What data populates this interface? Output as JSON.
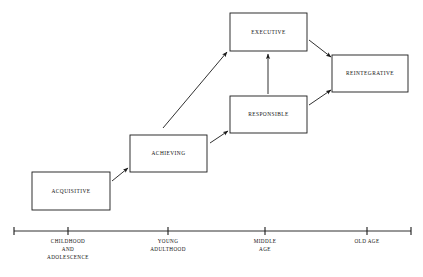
{
  "diagram": {
    "type": "staircase-flow-diagram",
    "background_color": "#ffffff",
    "line_color": "#1a1a1a",
    "stages": [
      {
        "id": "acquisitive",
        "label": "ACQUISITIVE",
        "box": {
          "x": 32,
          "y": 172,
          "width": 78,
          "height": 38
        },
        "center": {
          "x": 71,
          "y": 191
        },
        "order": 1
      },
      {
        "id": "achieving",
        "label": "ACHIEVING",
        "box": {
          "x": 130,
          "y": 135,
          "width": 77,
          "height": 37
        },
        "center": {
          "x": 168.5,
          "y": 153.5
        },
        "order": 2
      },
      {
        "id": "responsible",
        "label": "RESPONSIBLE",
        "box": {
          "x": 230,
          "y": 96,
          "width": 77,
          "height": 37
        },
        "center": {
          "x": 268.5,
          "y": 114.5
        },
        "order": 3
      },
      {
        "id": "executive",
        "label": "EXECUTIVE",
        "box": {
          "x": 230,
          "y": 13,
          "width": 77,
          "height": 38
        },
        "center": {
          "x": 268.5,
          "y": 32
        },
        "order": 4
      },
      {
        "id": "reintegrative",
        "label": "REINTEGRATIVE",
        "box": {
          "x": 332,
          "y": 55,
          "width": 76,
          "height": 37
        },
        "center": {
          "x": 370,
          "y": 73.5
        },
        "order": 5
      }
    ],
    "arrows": [
      {
        "id": "acquisitive-to-achieving",
        "from": "acquisitive",
        "to": "achieving",
        "x1": 112,
        "y1": 181,
        "x2": 128,
        "y2": 168
      },
      {
        "id": "achieving-to-responsible",
        "from": "achieving",
        "to": "responsible",
        "x1": 210,
        "y1": 143,
        "x2": 228,
        "y2": 131
      },
      {
        "id": "achieving-to-executive",
        "from": "achieving",
        "to": "executive",
        "x1": 163,
        "y1": 128,
        "x2": 227,
        "y2": 52
      },
      {
        "id": "responsible-to-executive",
        "from": "responsible",
        "to": "executive",
        "x1": 268,
        "y1": 94,
        "x2": 268,
        "y2": 54
      },
      {
        "id": "executive-to-reintegrative",
        "from": "executive",
        "to": "reintegrative",
        "x1": 309,
        "y1": 40,
        "x2": 331,
        "y2": 57
      },
      {
        "id": "responsible-to-reintegrative",
        "from": "responsible",
        "to": "reintegrative",
        "x1": 309,
        "y1": 105,
        "x2": 331,
        "y2": 90
      }
    ],
    "axis": {
      "id": "age-timeline",
      "y": 231,
      "x_start": 14,
      "x_end": 411,
      "end_ticks": [
        {
          "x": 14
        },
        {
          "x": 411
        }
      ],
      "ticks": [
        {
          "id": "childhood-and-adolescence",
          "x": 68,
          "lines": [
            "CHILDHOOD",
            "AND",
            "ADOLESCENCE"
          ]
        },
        {
          "id": "young-adulthood",
          "x": 168,
          "lines": [
            "YOUNG",
            "ADULTHOOD"
          ]
        },
        {
          "id": "middle-age",
          "x": 265,
          "lines": [
            "MIDDLE",
            "AGE"
          ]
        },
        {
          "id": "old-age",
          "x": 367,
          "lines": [
            "OLD  AGE"
          ]
        }
      ]
    }
  }
}
